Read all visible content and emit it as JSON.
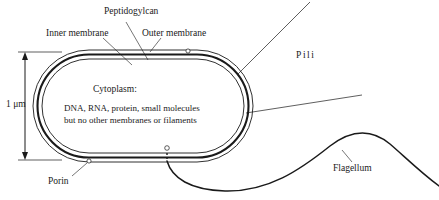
{
  "figure": {
    "background_color": "#ffffff",
    "stroke_color": "#1a1a1a",
    "width": 439,
    "height": 200
  },
  "scale_bar": {
    "label": "1 μm",
    "value": 1,
    "unit": "μm",
    "orientation": "vertical",
    "arrow_style": "double-headed"
  },
  "labels": {
    "peptidoglycan": "Peptidogylcan",
    "inner_membrane": "Inner membrane",
    "outer_membrane": "Outer membrane",
    "pili": "Pili",
    "porin": "Porin",
    "flagellum": "Flagellum"
  },
  "cytoplasm": {
    "heading": "Cytoplasm:",
    "line1": "DNA, RNA, protein, small molecules",
    "line2": "but no other membranes or filaments"
  },
  "structures": {
    "envelope_layers": [
      "outer membrane",
      "peptidoglycan",
      "inner membrane"
    ],
    "porin_count": 2,
    "pili_count": 2,
    "flagellum_count": 1
  }
}
